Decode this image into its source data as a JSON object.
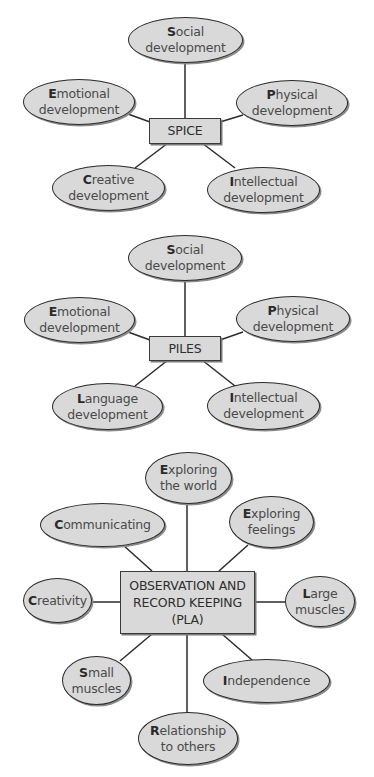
{
  "diagrams": [
    {
      "center": "SPICE",
      "nodes": [
        {
          "first": "S",
          "rest": "ocial\ndevelopment"
        },
        {
          "first": "E",
          "rest": "motional\ndevelopment"
        },
        {
          "first": "P",
          "rest": "hysical\ndevelopment"
        },
        {
          "first": "C",
          "rest": "reative\ndevelopment"
        },
        {
          "first": "I",
          "rest": "ntellectual\ndevelopment"
        }
      ]
    },
    {
      "center": "PILES",
      "nodes": [
        {
          "first": "S",
          "rest": "ocial\ndevelopment"
        },
        {
          "first": "E",
          "rest": "motional\ndevelopment"
        },
        {
          "first": "P",
          "rest": "hysical\ndevelopment"
        },
        {
          "first": "L",
          "rest": "anguage\ndevelopment"
        },
        {
          "first": "I",
          "rest": "ntellectual\ndevelopment"
        }
      ]
    },
    {
      "center": "OBSERVATION AND\nRECORD KEEPING\n(PLA)",
      "nodes": [
        {
          "first": "E",
          "rest": "xploring\nthe world"
        },
        {
          "first": "C",
          "rest": "ommunicating"
        },
        {
          "first": "E",
          "rest": "xploring\nfeelings"
        },
        {
          "first": "C",
          "rest": "reativity"
        },
        {
          "first": "L",
          "rest": "arge\nmuscles"
        },
        {
          "first": "S",
          "rest": "mall\nmuscles"
        },
        {
          "first": "I",
          "rest": "ndependence"
        },
        {
          "first": "R",
          "rest": "elationship\nto others"
        }
      ]
    }
  ],
  "colors": {
    "fill": "#d9d9d9",
    "stroke": "#2b2b2b",
    "text": "#4a4a4a"
  }
}
